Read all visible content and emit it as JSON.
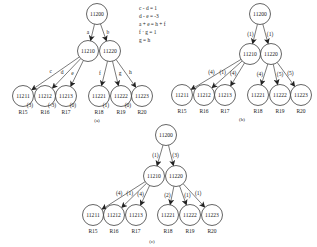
{
  "panels": [
    {
      "id": "a",
      "caption": "(a)",
      "root": "11200",
      "mid": [
        "11210",
        "11220"
      ],
      "top_edge_labels": [
        "a",
        "b"
      ],
      "leaves": [
        "11211",
        "11212",
        "11213",
        "11221",
        "11222",
        "11223"
      ],
      "leaf_edge_labels": [
        "c",
        "d",
        "e",
        "f",
        "g",
        "h"
      ],
      "leaf_values": [
        "(3)",
        "(-3)",
        "(0)",
        "(1)",
        "(0)",
        ""
      ],
      "rules": [
        "R15",
        "R16",
        "R17",
        "R18",
        "R19",
        "R20"
      ],
      "equations": [
        "c - d = 1",
        "d - e = -3",
        "a + e = h + f",
        "f · g = 1",
        "g = h"
      ]
    },
    {
      "id": "b",
      "caption": "(b)",
      "root": "11200",
      "mid": [
        "11210",
        "11220"
      ],
      "top_edge_labels": [
        "(1)",
        "(1)"
      ],
      "leaves": [
        "11211",
        "11212",
        "11213",
        "11221",
        "11222",
        "11223"
      ],
      "leaf_edge_labels": [
        "(4)",
        "(1)",
        "(4)",
        "(4)",
        "(5)",
        "(5)"
      ],
      "rules": [
        "R15",
        "R16",
        "R17",
        "R18",
        "R19",
        "R20"
      ]
    },
    {
      "id": "c",
      "caption": "(c)",
      "root": "11200",
      "mid": [
        "11210",
        "11220"
      ],
      "top_edge_labels": [
        "(1)",
        "(3)"
      ],
      "leaves": [
        "11211",
        "11212",
        "11213",
        "11221",
        "11222",
        "11223"
      ],
      "leaf_edge_labels": [
        "(4)",
        "(1)",
        "(4)",
        "(2)",
        "(1)",
        "(1)"
      ],
      "rules": [
        "R15",
        "R16",
        "R17",
        "R18",
        "R19",
        "R20"
      ]
    }
  ]
}
